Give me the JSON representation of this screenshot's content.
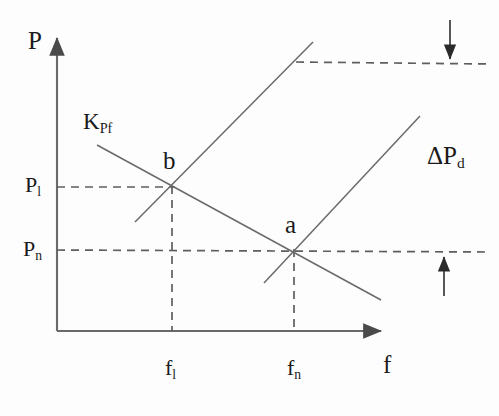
{
  "figure": {
    "type": "economics-line-diagram",
    "background_color": "#fdfdfd",
    "line_color": "#5a5a5a",
    "text_color": "#1a1a1a",
    "axes": {
      "y_axis_title": "P",
      "x_axis_title": "f",
      "origin": {
        "x": 57,
        "y": 331
      },
      "y_axis_top": {
        "x": 57,
        "y": 32
      },
      "x_axis_right": {
        "x": 387,
        "y": 331
      }
    },
    "y_ticks": [
      {
        "label_main": "P",
        "label_sub": "l",
        "y": 187
      },
      {
        "label_main": "P",
        "label_sub": "n",
        "y": 250
      }
    ],
    "x_ticks": [
      {
        "label_main": "f",
        "label_sub": "l",
        "x": 172
      },
      {
        "label_main": "f",
        "label_sub": "n",
        "x": 294
      }
    ],
    "points": [
      {
        "name": "b",
        "label": "b",
        "x": 172,
        "y": 187
      },
      {
        "name": "a",
        "label": "a",
        "x": 294,
        "y": 250
      }
    ],
    "curves": [
      {
        "name": "droop-curve-K-Pf",
        "label_main": "K",
        "label_sub": "Pf",
        "slope": "negative",
        "from": {
          "x": 97,
          "y": 145
        },
        "to": {
          "x": 381,
          "y": 300
        }
      },
      {
        "name": "load-line-shifted",
        "slope": "positive",
        "from": {
          "x": 135,
          "y": 222
        },
        "to": {
          "x": 313,
          "y": 42
        }
      },
      {
        "name": "load-line-original",
        "slope": "positive",
        "from": {
          "x": 264,
          "y": 283
        },
        "to": {
          "x": 420,
          "y": 116
        }
      }
    ],
    "annotations": [
      {
        "name": "delta-pd-label",
        "label_main": "ΔP",
        "label_sub": "d",
        "x": 428,
        "y": 146
      },
      {
        "name": "down-arrow-top-right",
        "direction": "down",
        "from": {
          "x": 450,
          "y": 20
        },
        "to": {
          "x": 450,
          "y": 66
        }
      },
      {
        "name": "up-arrow-right",
        "direction": "up",
        "from": {
          "x": 444,
          "y": 296
        },
        "to": {
          "x": 444,
          "y": 250
        }
      }
    ],
    "dashed_guides": [
      {
        "name": "upper-horizontal-dashed",
        "x1": 296,
        "y1": 62,
        "x2": 489,
        "y2": 64
      },
      {
        "name": "pl-horizontal-dashed",
        "x1": 57,
        "y1": 187,
        "x2": 172,
        "y2": 187
      },
      {
        "name": "pn-horizontal-dashed",
        "x1": 57,
        "y1": 250,
        "x2": 489,
        "y2": 252
      },
      {
        "name": "fl-vertical-dashed",
        "x1": 172,
        "y1": 187,
        "x2": 172,
        "y2": 331
      },
      {
        "name": "fn-vertical-dashed",
        "x1": 294,
        "y1": 250,
        "x2": 294,
        "y2": 331
      }
    ]
  }
}
